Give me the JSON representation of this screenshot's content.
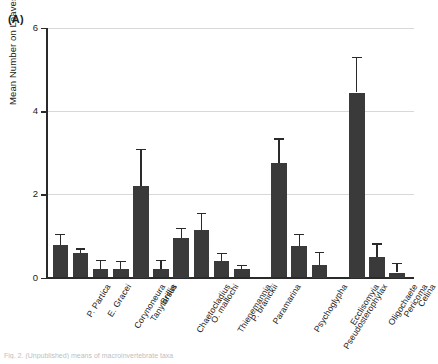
{
  "panel": {
    "label": "(A)"
  },
  "caption": {
    "text": "Fig. 2. (Unpublished) means of macroinvertebrate taxa"
  },
  "chart_data": {
    "type": "bar",
    "title": "",
    "subtitle": "",
    "xlabel": "",
    "ylabel": "Mean Number on Leaves",
    "ylim": [
      0,
      6
    ],
    "yticks": [
      0,
      2,
      4,
      6
    ],
    "grid": true,
    "legend": "none",
    "error_bars": "upper only",
    "bar_color": "#3a3a3a",
    "categories": [
      "P. Partica",
      "E. Gracei",
      "Corynoneura",
      "Tanytarsus",
      "Brillia",
      "Chaetocladius",
      "O. mallochi",
      "Thienemannia",
      "P. branickii",
      "Paramarina",
      "Psychoglypha",
      "Pseudosterophylax",
      "Ecclisomyia",
      "Oligochaete",
      "Pericoma",
      "Celina"
    ],
    "values": [
      0.78,
      0.58,
      0.2,
      0.2,
      2.2,
      0.2,
      0.95,
      1.15,
      0.4,
      0.2,
      2.75,
      0.75,
      0.3,
      4.45,
      0.5,
      0.12
    ],
    "error_upper": [
      1.05,
      0.7,
      0.42,
      0.4,
      3.1,
      0.42,
      1.2,
      1.55,
      0.6,
      0.3,
      3.35,
      1.05,
      0.62,
      5.3,
      0.82,
      0.35
    ],
    "group_breaks": [
      10,
      13
    ]
  }
}
